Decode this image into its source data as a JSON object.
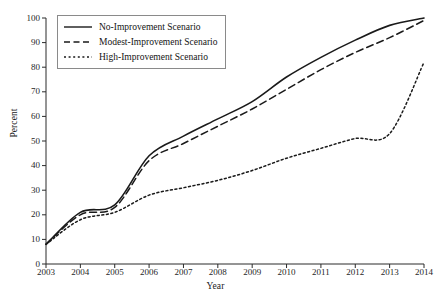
{
  "chart_data": {
    "type": "line",
    "title": "",
    "xlabel": "Year",
    "ylabel": "Percent",
    "x": [
      2003,
      2004,
      2005,
      2006,
      2007,
      2008,
      2009,
      2010,
      2011,
      2012,
      2013,
      2014
    ],
    "xlim": [
      2003,
      2014
    ],
    "ylim": [
      0,
      100
    ],
    "yticks": [
      0,
      10,
      20,
      30,
      40,
      50,
      60,
      70,
      80,
      90,
      100
    ],
    "xticks": [
      "2003",
      "2004",
      "2005",
      "2006",
      "2007",
      "2008",
      "2009",
      "2010",
      "2011",
      "2012",
      "2013",
      "2014"
    ],
    "grid": false,
    "legend_position": "top-left",
    "series": [
      {
        "name": "No-Improvement Scenario",
        "style": "solid",
        "color": "#1a1a1a",
        "values": [
          8,
          21,
          24,
          44,
          52,
          59,
          66,
          76,
          84,
          91,
          97,
          100
        ]
      },
      {
        "name": "Modest-Improvement Scenario",
        "style": "dashed",
        "color": "#1a1a1a",
        "values": [
          8,
          20,
          23,
          42,
          49,
          56,
          63,
          71,
          79,
          86,
          92,
          99
        ]
      },
      {
        "name": "High-Improvement Scenario",
        "style": "dotted",
        "color": "#1a1a1a",
        "values": [
          8,
          18,
          21,
          28,
          31,
          34,
          38,
          43,
          47,
          51,
          53,
          82
        ]
      }
    ]
  },
  "legend": {
    "items": [
      {
        "label": "No-Improvement Scenario",
        "style": "solid"
      },
      {
        "label": "Modest-Improvement Scenario",
        "style": "dashed"
      },
      {
        "label": "High-Improvement Scenario",
        "style": "dotted"
      }
    ]
  },
  "axes": {
    "y_title": "Percent",
    "x_title": "Year"
  }
}
